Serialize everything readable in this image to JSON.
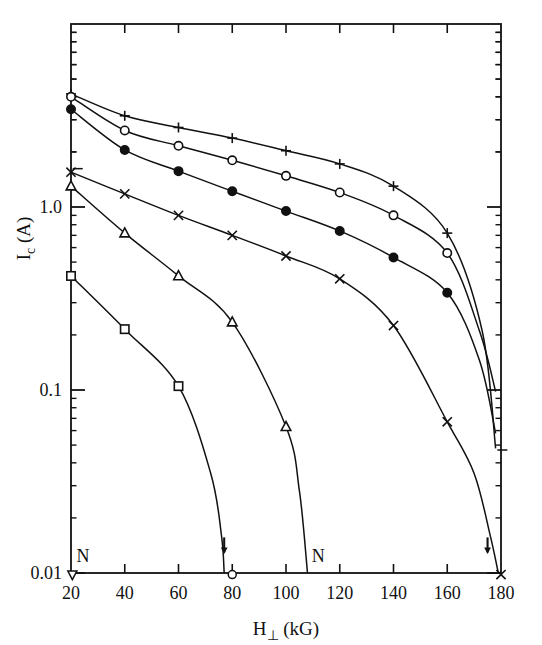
{
  "figure": {
    "background": "#ffffff",
    "ink": "#111111",
    "frame": {
      "left": 71,
      "right": 501,
      "top": 24,
      "bottom": 573
    }
  },
  "chart_data": {
    "type": "line",
    "title": "",
    "xlabel": "H⊥ (kG)",
    "ylabel": "Iᴄ (A)",
    "ylabel_parts": {
      "main": "I",
      "sub": "c",
      "unit": " (A)"
    },
    "xlabel_parts": {
      "main": "H",
      "sub": "⊥",
      "unit": " (kG)"
    },
    "xscale": "linear",
    "yscale": "log",
    "xlim": [
      20,
      180
    ],
    "ylim": [
      0.01,
      10.0
    ],
    "xticks": [
      20,
      40,
      60,
      80,
      100,
      120,
      140,
      160,
      180
    ],
    "xtick_labels": [
      "20",
      "40",
      "60",
      "80",
      "100",
      "120",
      "140",
      "160",
      "180"
    ],
    "yticks": [
      1.0,
      0.1,
      0.01
    ],
    "ytick_labels": [
      "1.0",
      "0.1",
      "0.01"
    ],
    "y_minor_decades": [
      0.01,
      0.1,
      1.0
    ],
    "grid": false,
    "legend": null,
    "legend_position": "none",
    "frame_ticks": {
      "top": "inward",
      "right": "inward",
      "left": "inward",
      "bottom": "inward"
    },
    "series": [
      {
        "name": "plus",
        "marker": "plus",
        "x": [
          20,
          40,
          60,
          80,
          100,
          120,
          140,
          160,
          173,
          178
        ],
        "y": [
          4.15,
          3.15,
          2.72,
          2.38,
          2.03,
          1.72,
          1.3,
          0.72,
          0.21,
          0.048
        ]
      },
      {
        "name": "open-circle",
        "marker": "circle-open",
        "x": [
          20,
          40,
          60,
          80,
          100,
          120,
          140,
          160,
          172,
          178
        ],
        "y": [
          4.0,
          2.62,
          2.16,
          1.8,
          1.48,
          1.2,
          0.9,
          0.56,
          0.21,
          0.098
        ]
      },
      {
        "name": "filled-circle",
        "marker": "circle-filled",
        "x": [
          20,
          40,
          60,
          80,
          100,
          120,
          140,
          160,
          172,
          178
        ],
        "y": [
          3.42,
          2.05,
          1.57,
          1.22,
          0.95,
          0.74,
          0.53,
          0.34,
          0.145,
          0.058
        ]
      },
      {
        "name": "cross",
        "marker": "x",
        "x": [
          20,
          40,
          60,
          80,
          100,
          120,
          140,
          160,
          170,
          176,
          179
        ],
        "y": [
          1.55,
          1.18,
          0.9,
          0.7,
          0.54,
          0.405,
          0.225,
          0.067,
          0.035,
          0.016,
          0.01
        ]
      },
      {
        "name": "open-triangle",
        "marker": "triangle-open",
        "x": [
          20,
          40,
          60,
          80,
          100,
          105,
          108
        ],
        "y": [
          1.3,
          0.72,
          0.42,
          0.235,
          0.063,
          0.028,
          0.01
        ]
      },
      {
        "name": "open-square",
        "marker": "square-open",
        "x": [
          20,
          40,
          60,
          72,
          76,
          77
        ],
        "y": [
          0.42,
          0.215,
          0.105,
          0.035,
          0.016,
          0.01
        ]
      }
    ],
    "annotations": [
      {
        "label": "N",
        "x": 24.5,
        "y": 0.0115,
        "kind": "text"
      },
      {
        "label": "N",
        "x": 112,
        "y": 0.0115,
        "kind": "text"
      },
      {
        "label": "↓",
        "x": 77,
        "y": 0.0128,
        "kind": "down-arrow"
      },
      {
        "label": "↓",
        "x": 175,
        "y": 0.0128,
        "kind": "down-arrow"
      },
      {
        "label": "○",
        "x": 80,
        "y": 0.0098,
        "kind": "endpoint-marker-circle"
      },
      {
        "label": "▽",
        "x": 20.5,
        "y": 0.0098,
        "kind": "endpoint-marker-triangle"
      },
      {
        "label": "×",
        "x": 180,
        "y": 0.0098,
        "kind": "endpoint-marker-cross"
      },
      {
        "label": "−",
        "x": 22.5,
        "y": 1.62,
        "kind": "tick-dash"
      },
      {
        "label": "−",
        "x": 180.5,
        "y": 0.047,
        "kind": "tick-dash"
      }
    ]
  }
}
